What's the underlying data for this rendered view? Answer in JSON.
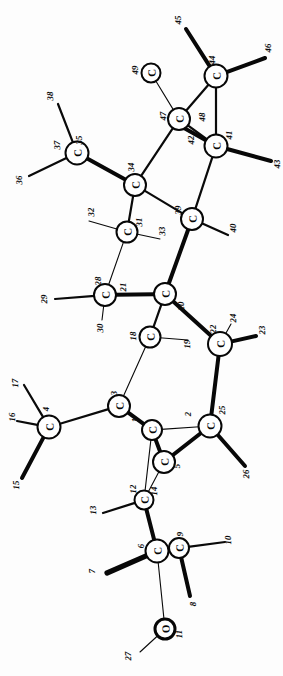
{
  "diagram": {
    "kind": "chemical-structure",
    "orientation": "rotated-90",
    "background_color": "#fdfdfd",
    "line_color": "#0a0a0a",
    "atom_fill": "#ffffff"
  },
  "atoms": [
    {
      "id": "a1",
      "element": "C",
      "x": 152,
      "y": 430,
      "r": 10.0,
      "weight": "normal"
    },
    {
      "id": "a5",
      "element": "C",
      "x": 164,
      "y": 462,
      "r": 11.0,
      "weight": "normal"
    },
    {
      "id": "a3",
      "element": "C",
      "x": 119,
      "y": 406,
      "r": 11.0,
      "weight": "normal"
    },
    {
      "id": "a4",
      "element": "C",
      "x": 49,
      "y": 427,
      "r": 11.5,
      "weight": "normal"
    },
    {
      "id": "a6",
      "element": "C",
      "x": 157,
      "y": 551,
      "r": 11.5,
      "weight": "normal"
    },
    {
      "id": "a9",
      "element": "C",
      "x": 179,
      "y": 548,
      "r": 10.0,
      "weight": "normal"
    },
    {
      "id": "a11",
      "element": "O",
      "x": 165,
      "y": 629,
      "r": 10.0,
      "weight": "heavy"
    },
    {
      "id": "a12",
      "element": "C",
      "x": 144,
      "y": 500,
      "r": 9.5,
      "weight": "normal"
    },
    {
      "id": "a25",
      "element": "C",
      "x": 210,
      "y": 426,
      "r": 11.5,
      "weight": "normal"
    },
    {
      "id": "a22",
      "element": "C",
      "x": 220,
      "y": 344,
      "r": 12.0,
      "weight": "normal"
    },
    {
      "id": "a18",
      "element": "C",
      "x": 150,
      "y": 337,
      "r": 10.5,
      "weight": "normal"
    },
    {
      "id": "a20",
      "element": "C",
      "x": 165,
      "y": 294,
      "r": 11.0,
      "weight": "normal"
    },
    {
      "id": "a28",
      "element": "C",
      "x": 105,
      "y": 295,
      "r": 11.0,
      "weight": "normal"
    },
    {
      "id": "a31",
      "element": "C",
      "x": 127,
      "y": 232,
      "r": 10.5,
      "weight": "normal"
    },
    {
      "id": "a39",
      "element": "C",
      "x": 192,
      "y": 219,
      "r": 11.0,
      "weight": "normal"
    },
    {
      "id": "a34",
      "element": "C",
      "x": 135,
      "y": 185,
      "r": 11.0,
      "weight": "normal"
    },
    {
      "id": "a35",
      "element": "C",
      "x": 77,
      "y": 153,
      "r": 11.5,
      "weight": "normal"
    },
    {
      "id": "a41",
      "element": "C",
      "x": 216,
      "y": 146,
      "r": 11.5,
      "weight": "normal"
    },
    {
      "id": "a47",
      "element": "C",
      "x": 179,
      "y": 119,
      "r": 11.0,
      "weight": "normal"
    },
    {
      "id": "a44",
      "element": "C",
      "x": 216,
      "y": 76,
      "r": 11.5,
      "weight": "normal"
    },
    {
      "id": "a49",
      "element": "C",
      "x": 151,
      "y": 73,
      "r": 9.5,
      "weight": "normal"
    }
  ],
  "bonds": [
    {
      "from": "a11",
      "to": "a6",
      "style": "thin",
      "note": "O to C6"
    },
    {
      "from": "a11",
      "to": "n27",
      "style": "thin",
      "note": "O substituent 27"
    },
    {
      "from": "a6",
      "to": "a9",
      "style": "med"
    },
    {
      "from": "a6",
      "to": "n7",
      "style": "xbold"
    },
    {
      "from": "a9",
      "to": "n10",
      "style": "med"
    },
    {
      "from": "a9",
      "to": "n8",
      "style": "bold"
    },
    {
      "from": "a6",
      "to": "a12",
      "style": "bold"
    },
    {
      "from": "a12",
      "to": "n13",
      "style": "med"
    },
    {
      "from": "a12",
      "to": "a5",
      "style": "thin"
    },
    {
      "from": "a12",
      "to": "a1",
      "style": "thin"
    },
    {
      "from": "a5",
      "to": "a1",
      "style": "bold"
    },
    {
      "from": "a5",
      "to": "a25",
      "style": "bold"
    },
    {
      "from": "a1",
      "to": "a3",
      "style": "bold"
    },
    {
      "from": "a1",
      "to": "a25",
      "style": "thin"
    },
    {
      "from": "a3",
      "to": "a4",
      "style": "med"
    },
    {
      "from": "a3",
      "to": "a18",
      "style": "thin"
    },
    {
      "from": "a4",
      "to": "n15",
      "style": "bold"
    },
    {
      "from": "a4",
      "to": "n16",
      "style": "med"
    },
    {
      "from": "a4",
      "to": "n17",
      "style": "med"
    },
    {
      "from": "a25",
      "to": "a22",
      "style": "bold"
    },
    {
      "from": "a25",
      "to": "n26",
      "style": "bold"
    },
    {
      "from": "a22",
      "to": "n23",
      "style": "bold"
    },
    {
      "from": "a22",
      "to": "n24",
      "style": "thin"
    },
    {
      "from": "a22",
      "to": "a20",
      "style": "bold"
    },
    {
      "from": "a18",
      "to": "a20",
      "style": "med"
    },
    {
      "from": "a18",
      "to": "n19",
      "style": "thin"
    },
    {
      "from": "a20",
      "to": "a28",
      "style": "bold"
    },
    {
      "from": "a28",
      "to": "n29",
      "style": "med"
    },
    {
      "from": "a28",
      "to": "n30",
      "style": "thin"
    },
    {
      "from": "a28",
      "to": "a31",
      "style": "thin"
    },
    {
      "from": "a20",
      "to": "a39",
      "style": "bold"
    },
    {
      "from": "a31",
      "to": "n32",
      "style": "thin"
    },
    {
      "from": "a31",
      "to": "n33",
      "style": "thin"
    },
    {
      "from": "a31",
      "to": "a34",
      "style": "med"
    },
    {
      "from": "a39",
      "to": "n40",
      "style": "med"
    },
    {
      "from": "a39",
      "to": "a34",
      "style": "med"
    },
    {
      "from": "a39",
      "to": "a41",
      "style": "med"
    },
    {
      "from": "a34",
      "to": "a35",
      "style": "bold"
    },
    {
      "from": "a35",
      "to": "n36",
      "style": "med"
    },
    {
      "from": "a35",
      "to": "n38",
      "style": "med"
    },
    {
      "from": "a34",
      "to": "a47",
      "style": "med"
    },
    {
      "from": "a41",
      "to": "a47",
      "style": "med"
    },
    {
      "from": "a41",
      "to": "a44",
      "style": "med"
    },
    {
      "from": "a41",
      "to": "n42",
      "style": "bold"
    },
    {
      "from": "a41",
      "to": "n43",
      "style": "bold"
    },
    {
      "from": "a47",
      "to": "a44",
      "style": "med"
    },
    {
      "from": "a47",
      "to": "a49",
      "style": "thin"
    },
    {
      "from": "a44",
      "to": "n45",
      "style": "bold"
    },
    {
      "from": "a44",
      "to": "n46",
      "style": "bold"
    }
  ],
  "terminals": [
    {
      "id": "n7",
      "x": 107,
      "y": 573
    },
    {
      "id": "n8",
      "x": 190,
      "y": 596
    },
    {
      "id": "n10",
      "x": 225,
      "y": 542
    },
    {
      "id": "n27",
      "x": 140,
      "y": 652
    },
    {
      "id": "n13",
      "x": 103,
      "y": 513
    },
    {
      "id": "n15",
      "x": 22,
      "y": 478
    },
    {
      "id": "n16",
      "x": 17,
      "y": 421
    },
    {
      "id": "n17",
      "x": 24,
      "y": 385
    },
    {
      "id": "n19",
      "x": 188,
      "y": 340
    },
    {
      "id": "n23",
      "x": 256,
      "y": 336
    },
    {
      "id": "n24",
      "x": 231,
      "y": 324
    },
    {
      "id": "n26",
      "x": 245,
      "y": 466
    },
    {
      "id": "n29",
      "x": 55,
      "y": 299
    },
    {
      "id": "n30",
      "x": 102,
      "y": 320
    },
    {
      "id": "n32",
      "x": 89,
      "y": 221
    },
    {
      "id": "n33",
      "x": 160,
      "y": 239
    },
    {
      "id": "n36",
      "x": 29,
      "y": 176
    },
    {
      "id": "n38",
      "x": 58,
      "y": 104
    },
    {
      "id": "n40",
      "x": 228,
      "y": 235
    },
    {
      "id": "n42",
      "x": 184,
      "y": 128
    },
    {
      "id": "n43",
      "x": 271,
      "y": 161
    },
    {
      "id": "n45",
      "x": 186,
      "y": 29
    },
    {
      "id": "n46",
      "x": 265,
      "y": 58
    }
  ],
  "number_labels": [
    {
      "text": "1",
      "x": 135,
      "y": 420,
      "rot": -92
    },
    {
      "text": "2",
      "x": 188,
      "y": 414,
      "rot": -92
    },
    {
      "text": "3",
      "x": 114,
      "y": 393,
      "rot": -92
    },
    {
      "text": "4",
      "x": 46,
      "y": 409,
      "rot": -92
    },
    {
      "text": "5",
      "x": 177,
      "y": 466,
      "rot": -92
    },
    {
      "text": "6",
      "x": 141,
      "y": 546,
      "rot": -92
    },
    {
      "text": "7",
      "x": 92,
      "y": 571,
      "rot": -92
    },
    {
      "text": "8",
      "x": 193,
      "y": 604,
      "rot": -92
    },
    {
      "text": "9",
      "x": 180,
      "y": 534,
      "rot": -92
    },
    {
      "text": "10",
      "x": 228,
      "y": 540,
      "rot": -92
    },
    {
      "text": "11",
      "x": 179,
      "y": 634,
      "rot": -92
    },
    {
      "text": "12",
      "x": 133,
      "y": 489,
      "rot": -92
    },
    {
      "text": "13",
      "x": 93,
      "y": 510,
      "rot": -92
    },
    {
      "text": "14",
      "x": 154,
      "y": 491,
      "rot": -92
    },
    {
      "text": "15",
      "x": 16,
      "y": 485,
      "rot": -92
    },
    {
      "text": "16",
      "x": 12,
      "y": 417,
      "rot": -92
    },
    {
      "text": "17",
      "x": 15,
      "y": 383,
      "rot": -92
    },
    {
      "text": "18",
      "x": 133,
      "y": 336,
      "rot": -92
    },
    {
      "text": "19",
      "x": 187,
      "y": 344,
      "rot": -92
    },
    {
      "text": "20",
      "x": 181,
      "y": 306,
      "rot": -92
    },
    {
      "text": "21",
      "x": 123,
      "y": 287,
      "rot": -92
    },
    {
      "text": "22",
      "x": 213,
      "y": 329,
      "rot": -92
    },
    {
      "text": "23",
      "x": 262,
      "y": 330,
      "rot": -92
    },
    {
      "text": "24",
      "x": 233,
      "y": 318,
      "rot": -92
    },
    {
      "text": "25",
      "x": 222,
      "y": 410,
      "rot": -92
    },
    {
      "text": "26",
      "x": 246,
      "y": 474,
      "rot": -92
    },
    {
      "text": "27",
      "x": 128,
      "y": 656,
      "rot": -92
    },
    {
      "text": "28",
      "x": 98,
      "y": 281,
      "rot": -92
    },
    {
      "text": "29",
      "x": 44,
      "y": 299,
      "rot": -92
    },
    {
      "text": "30",
      "x": 100,
      "y": 328,
      "rot": -92
    },
    {
      "text": "31",
      "x": 139,
      "y": 222,
      "rot": -92
    },
    {
      "text": "32",
      "x": 91,
      "y": 212,
      "rot": -92
    },
    {
      "text": "33",
      "x": 162,
      "y": 231,
      "rot": -92
    },
    {
      "text": "34",
      "x": 131,
      "y": 167,
      "rot": -92
    },
    {
      "text": "35",
      "x": 79,
      "y": 140,
      "rot": -92
    },
    {
      "text": "36",
      "x": 19,
      "y": 180,
      "rot": -92
    },
    {
      "text": "38",
      "x": 50,
      "y": 96,
      "rot": -92
    },
    {
      "text": "37",
      "x": 57,
      "y": 145,
      "rot": -92
    },
    {
      "text": "39",
      "x": 178,
      "y": 210,
      "rot": -92
    },
    {
      "text": "40",
      "x": 233,
      "y": 228,
      "rot": -92
    },
    {
      "text": "41",
      "x": 229,
      "y": 135,
      "rot": -92
    },
    {
      "text": "42",
      "x": 191,
      "y": 140,
      "rot": -92
    },
    {
      "text": "43",
      "x": 277,
      "y": 164,
      "rot": -92
    },
    {
      "text": "44",
      "x": 212,
      "y": 60,
      "rot": -92
    },
    {
      "text": "45",
      "x": 178,
      "y": 20,
      "rot": -92
    },
    {
      "text": "46",
      "x": 268,
      "y": 48,
      "rot": -92
    },
    {
      "text": "47",
      "x": 163,
      "y": 116,
      "rot": -92
    },
    {
      "text": "48",
      "x": 202,
      "y": 117,
      "rot": -92
    },
    {
      "text": "49",
      "x": 135,
      "y": 70,
      "rot": -92
    }
  ]
}
